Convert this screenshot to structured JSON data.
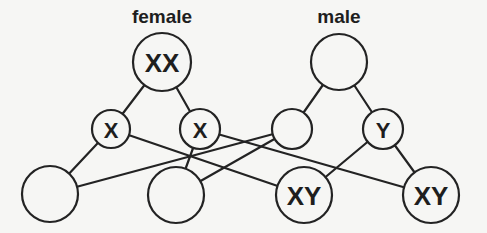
{
  "headings": {
    "female": "female",
    "male": "male"
  },
  "nodes": [
    {
      "id": "female-parent",
      "label": "XX",
      "cx": 162,
      "cy": 62,
      "r": 29,
      "font_size": 26
    },
    {
      "id": "male-parent",
      "label": "",
      "cx": 339,
      "cy": 62,
      "r": 28,
      "font_size": 26
    },
    {
      "id": "female-gamete-1",
      "label": "X",
      "cx": 111,
      "cy": 129,
      "r": 19,
      "font_size": 22
    },
    {
      "id": "female-gamete-2",
      "label": "X",
      "cx": 200,
      "cy": 129,
      "r": 20,
      "font_size": 22
    },
    {
      "id": "male-gamete-1",
      "label": "",
      "cx": 292,
      "cy": 129,
      "r": 20,
      "font_size": 22
    },
    {
      "id": "male-gamete-2",
      "label": "Y",
      "cx": 383,
      "cy": 129,
      "r": 20,
      "font_size": 22
    },
    {
      "id": "offspring-1",
      "label": "",
      "cx": 50,
      "cy": 194,
      "r": 28,
      "font_size": 26
    },
    {
      "id": "offspring-2",
      "label": "",
      "cx": 176,
      "cy": 195,
      "r": 28,
      "font_size": 26
    },
    {
      "id": "offspring-3",
      "label": "XY",
      "cx": 304,
      "cy": 195,
      "r": 28,
      "font_size": 26
    },
    {
      "id": "offspring-4",
      "label": "XY",
      "cx": 431,
      "cy": 195,
      "r": 28,
      "font_size": 26
    }
  ],
  "edges": [
    {
      "from": "female-parent",
      "to": "female-gamete-1"
    },
    {
      "from": "female-parent",
      "to": "female-gamete-2"
    },
    {
      "from": "male-parent",
      "to": "male-gamete-1"
    },
    {
      "from": "male-parent",
      "to": "male-gamete-2"
    },
    {
      "from": "female-gamete-1",
      "to": "offspring-1"
    },
    {
      "from": "female-gamete-1",
      "to": "offspring-3"
    },
    {
      "from": "female-gamete-2",
      "to": "offspring-2"
    },
    {
      "from": "female-gamete-2",
      "to": "offspring-4"
    },
    {
      "from": "male-gamete-1",
      "to": "offspring-1"
    },
    {
      "from": "male-gamete-1",
      "to": "offspring-2"
    },
    {
      "from": "male-gamete-2",
      "to": "offspring-3"
    },
    {
      "from": "male-gamete-2",
      "to": "offspring-4"
    }
  ],
  "colors": {
    "background": "#f6f6f4",
    "stroke": "#232323",
    "text": "#1e1e1e"
  }
}
